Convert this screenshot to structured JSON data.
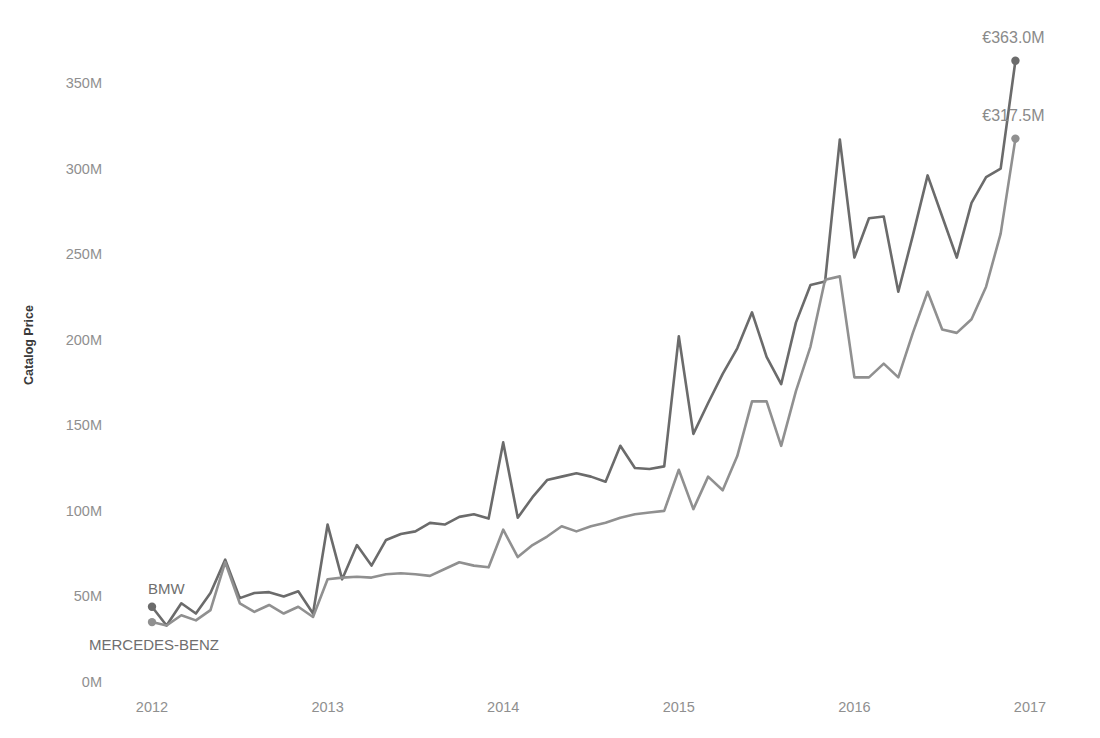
{
  "chart_data": {
    "type": "line",
    "title": "",
    "xlabel": "",
    "ylabel": "Catalog Price",
    "currency_symbol": "€",
    "grid": false,
    "legend_position": "inline-labels",
    "xlim": [
      2012.0,
      2017.0
    ],
    "ylim": [
      0,
      365
    ],
    "y_ticks": [
      0,
      50,
      100,
      150,
      200,
      250,
      300,
      350
    ],
    "y_tick_labels": [
      "0M",
      "50M",
      "100M",
      "150M",
      "200M",
      "250M",
      "300M",
      "350M"
    ],
    "x_ticks": [
      2012,
      2013,
      2014,
      2015,
      2016,
      2017
    ],
    "x_tick_labels": [
      "2012",
      "2013",
      "2014",
      "2015",
      "2016",
      "2017"
    ],
    "units": "millions of euros",
    "x": [
      2012.0,
      2012.083,
      2012.167,
      2012.25,
      2012.333,
      2012.417,
      2012.5,
      2012.583,
      2012.667,
      2012.75,
      2012.833,
      2012.917,
      2013.0,
      2013.083,
      2013.167,
      2013.25,
      2013.333,
      2013.417,
      2013.5,
      2013.583,
      2013.667,
      2013.75,
      2013.833,
      2013.917,
      2014.0,
      2014.083,
      2014.167,
      2014.25,
      2014.333,
      2014.417,
      2014.5,
      2014.583,
      2014.667,
      2014.75,
      2014.833,
      2014.917,
      2015.0,
      2015.083,
      2015.167,
      2015.25,
      2015.333,
      2015.417,
      2015.5,
      2015.583,
      2015.667,
      2015.75,
      2015.833,
      2015.917,
      2016.0,
      2016.083,
      2016.167,
      2016.25,
      2016.333,
      2016.417,
      2016.5,
      2016.583,
      2016.667,
      2016.75,
      2016.833,
      2016.917
    ],
    "series": [
      {
        "name": "BMW",
        "color": "#6b6b6b",
        "label_position": "above-start",
        "start_value": 44.0,
        "end_value": 363.0,
        "end_label": "€363.0M",
        "values": [
          44.0,
          33.0,
          46.0,
          40.0,
          52.0,
          71.5,
          49.0,
          52.0,
          52.5,
          50.0,
          53.0,
          40.0,
          92.0,
          60.0,
          80.0,
          68.0,
          83.0,
          86.5,
          88.0,
          93.0,
          92.0,
          96.5,
          98.0,
          95.5,
          140.0,
          96.0,
          108.0,
          118.0,
          120.0,
          122.0,
          120.0,
          117.0,
          138.0,
          125.0,
          124.5,
          126.0,
          202.0,
          145.0,
          163.0,
          180.0,
          195.0,
          216.0,
          190.0,
          174.0,
          210.0,
          232.0,
          234.0,
          317.0,
          248.0,
          271.0,
          272.0,
          228.0,
          261.0,
          296.0,
          272.0,
          248.0,
          280.0,
          295.0,
          300.0,
          363.0
        ]
      },
      {
        "name": "MERCEDES-BENZ",
        "color": "#909090",
        "label_position": "below-start",
        "start_value": 35.0,
        "end_value": 317.5,
        "end_label": "€317.5M",
        "values": [
          35.0,
          33.0,
          39.0,
          36.0,
          42.0,
          70.0,
          46.0,
          41.0,
          45.0,
          40.0,
          44.0,
          38.0,
          60.0,
          61.0,
          61.5,
          61.0,
          63.0,
          63.5,
          63.0,
          62.0,
          66.0,
          70.0,
          68.0,
          67.0,
          89.0,
          73.0,
          80.0,
          85.0,
          91.0,
          88.0,
          91.0,
          93.0,
          96.0,
          98.0,
          99.0,
          100.0,
          124.0,
          101.0,
          120.0,
          112.0,
          132.0,
          164.0,
          164.0,
          138.0,
          170.0,
          196.0,
          235.0,
          237.0,
          178.0,
          178.0,
          186.0,
          178.0,
          204.0,
          228.0,
          206.0,
          204.0,
          212.0,
          231.0,
          262.0,
          317.5
        ]
      }
    ],
    "annotations": [
      {
        "name": "bmw-end-label",
        "text": "€363.0M",
        "series": "BMW",
        "at_x": 2016.917,
        "at_y": 363.0
      },
      {
        "name": "mercedes-end-label",
        "text": "€317.5M",
        "series": "MERCEDES-BENZ",
        "at_x": 2016.917,
        "at_y": 317.5
      },
      {
        "name": "bmw-start-label",
        "text": "BMW",
        "series": "BMW",
        "at_x": 2012.0,
        "at_y": 44.0
      },
      {
        "name": "mercedes-start-label",
        "text": "MERCEDES-BENZ",
        "series": "MERCEDES-BENZ",
        "at_x": 2012.0,
        "at_y": 35.0
      }
    ]
  },
  "axis": {
    "y_title": "Catalog Price"
  },
  "labels": {
    "bmw_name": "BMW",
    "mercedes_name": "MERCEDES-BENZ",
    "bmw_end": "€363.0M",
    "mercedes_end": "€317.5M"
  },
  "colors": {
    "bmw_line": "#6b6b6b",
    "mercedes_line": "#909090",
    "tick_text": "#8f8f8f",
    "axis_title": "#3a3a3a",
    "background": "#ffffff"
  }
}
